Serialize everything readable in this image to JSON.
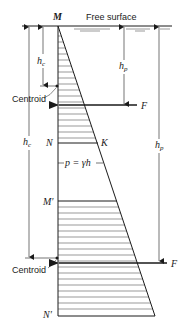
{
  "diagram": {
    "free_surface_label": "Free surface",
    "points": {
      "M": "M",
      "N": "N",
      "K": "K",
      "M_prime": "M′",
      "N_prime": "N′"
    },
    "depths": {
      "hc_upper": "h",
      "hc_upper_sub": "c",
      "hp_upper": "h",
      "hp_upper_sub": "p",
      "hc_lower": "h",
      "hc_lower_sub": "c",
      "hp_lower": "h",
      "hp_lower_sub": "p"
    },
    "centroid_upper": "Centroid",
    "centroid_lower": "Centroid",
    "force_upper": "F",
    "force_lower": "F",
    "pressure_eq": "p = γh"
  }
}
